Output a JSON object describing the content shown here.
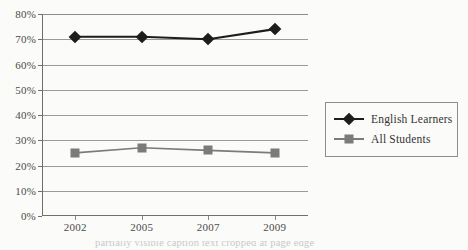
{
  "chart_data": {
    "type": "line",
    "title": "",
    "subtitle": "",
    "xlabel": "",
    "ylabel": "",
    "categories": [
      "2002",
      "2005",
      "2007",
      "2009"
    ],
    "ylim": [
      0,
      80
    ],
    "ytick_step": 10,
    "ytick_labels": [
      "80%",
      "70%",
      "60%",
      "50%",
      "40%",
      "30%",
      "20%",
      "10%",
      "0%"
    ],
    "ytick_values": [
      80,
      70,
      60,
      50,
      40,
      30,
      20,
      10,
      0
    ],
    "grid": true,
    "grid_axis": "y",
    "legend_position": "right",
    "series": [
      {
        "name": "English Learners",
        "values": [
          71,
          71,
          70,
          74
        ],
        "color": "#1d1d1d",
        "marker": "diamond"
      },
      {
        "name": "All Students",
        "values": [
          25,
          27,
          26,
          25
        ],
        "color": "#7b7b7b",
        "marker": "square"
      }
    ]
  },
  "legend": {
    "entries": [
      {
        "label": "English Learners",
        "marker": "diamond-marker",
        "color": "#1d1d1d"
      },
      {
        "label": "All Students",
        "marker": "square-marker",
        "color": "#7b7b7b"
      }
    ]
  },
  "caption": {
    "text": "partially visible caption text cropped at page edge"
  },
  "colors": {
    "background": "#fbfbf9",
    "gridline": "#9a9a9a",
    "axis": "#6f6f6f",
    "tick_text": "#4a4a4a",
    "series_primary": "#1d1d1d",
    "series_secondary": "#7b7b7b",
    "legend_border": "#8e8e8e"
  }
}
